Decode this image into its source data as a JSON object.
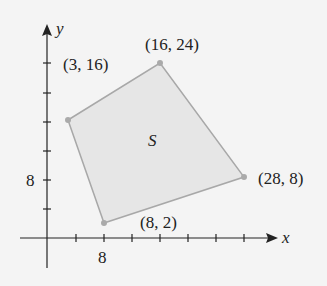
{
  "diagram": {
    "region_label": "S",
    "axes": {
      "x_label": "x",
      "y_label": "y",
      "x_tick_label": "8",
      "y_tick_label": "8"
    },
    "vertices": [
      {
        "label": "(3, 16)",
        "x": 3,
        "y": 16
      },
      {
        "label": "(16, 24)",
        "x": 16,
        "y": 24
      },
      {
        "label": "(28, 8)",
        "x": 28,
        "y": 8
      },
      {
        "label": "(8, 2)",
        "x": 8,
        "y": 2
      }
    ],
    "colors": {
      "fill": "#e6e6e6",
      "stroke": "#a8a8a8",
      "axis": "#222222",
      "background": "#f4f4f4"
    }
  }
}
